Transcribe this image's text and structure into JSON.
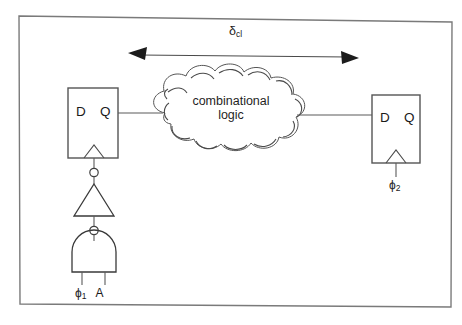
{
  "figure": {
    "background_color": "#ffffff",
    "line_color": "#4a4a4a",
    "frame": {
      "name": "figure-border",
      "visible": true,
      "color": "#7a7a7a"
    }
  },
  "delay_arrow": {
    "label_symbol": "δ",
    "label_subscript": "cl",
    "direction": "double-headed",
    "from_x": 130,
    "to_x": 356,
    "y": 55
  },
  "flipflop_left": {
    "name": "flip-flop-1",
    "d_label": "D",
    "q_label": "Q",
    "clock_symbol": "edge-triggered",
    "has_inverting_clock_bubble": true
  },
  "flipflop_right": {
    "name": "flip-flop-2",
    "d_label": "D",
    "q_label": "Q",
    "clock_symbol": "edge-triggered",
    "clock_label_symbol": "ϕ",
    "clock_label_subscript": "2",
    "has_inverting_clock_bubble": false
  },
  "cloud": {
    "name": "combinational-logic-cloud",
    "line1": "combinational",
    "line2": "logic"
  },
  "gates": {
    "inverter": {
      "name": "inverter-gate",
      "type": "NOT",
      "orientation": "pointing-up",
      "bubble_position": "top"
    },
    "nand": {
      "name": "nand-gate",
      "type": "NAND",
      "orientation": "pointing-up",
      "bubble_position": "top",
      "inputs": [
        {
          "symbol": "ϕ",
          "subscript": "1"
        },
        {
          "symbol": "A",
          "subscript": ""
        }
      ]
    }
  },
  "input_labels": {
    "phi1": "ϕ",
    "phi1_sub": "1",
    "a": "A"
  }
}
